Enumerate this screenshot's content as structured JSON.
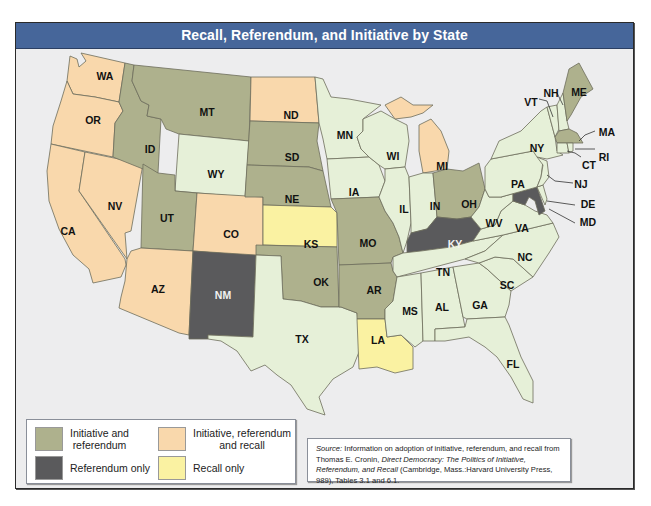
{
  "title": "Recall, Referendum, and Initiative by State",
  "colors": {
    "initiative_referendum": "#aeb18d",
    "initiative_referendum_recall": "#f9d8ac",
    "referendum_only": "#5a5a5c",
    "recall_only": "#faf2a2",
    "none": "#e6f0d8",
    "water": "#ededee",
    "title_bar": "#46669a"
  },
  "legend": {
    "items": [
      {
        "key": "initiative_referendum",
        "label_line1": "Initiative and",
        "label_line2": "referendum"
      },
      {
        "key": "initiative_referendum_recall",
        "label_line1": "Initiative, referendum",
        "label_line2": "and recall"
      },
      {
        "key": "referendum_only",
        "label_line1": "Referendum only",
        "label_line2": ""
      },
      {
        "key": "recall_only",
        "label_line1": "Recall only",
        "label_line2": ""
      }
    ]
  },
  "source": {
    "label": "Source:",
    "text1": " Information on adoption of initiative, referendum, and recall from Thomas E. Cronin, ",
    "italic1": "Direct Democracy: The Politics of Initiative, Referendum, and Recall",
    "text2": " (Cambridge, Mass.:Harvard  University Press, 989), Tables 3.1 and 6.1."
  },
  "states": {
    "WA": "initiative_referendum_recall",
    "OR": "initiative_referendum_recall",
    "CA": "initiative_referendum_recall",
    "NV": "initiative_referendum_recall",
    "AZ": "initiative_referendum_recall",
    "CO": "initiative_referendum_recall",
    "ND": "initiative_referendum_recall",
    "MI": "initiative_referendum_recall",
    "ID": "initiative_referendum",
    "MT": "initiative_referendum",
    "UT": "initiative_referendum",
    "SD": "initiative_referendum",
    "NE": "initiative_referendum",
    "OK": "initiative_referendum",
    "MO": "initiative_referendum",
    "AR": "initiative_referendum",
    "OH": "initiative_referendum",
    "ME": "initiative_referendum",
    "MA": "initiative_referendum",
    "NM": "referendum_only",
    "KY": "referendum_only",
    "MD": "referendum_only",
    "KS": "recall_only",
    "LA": "recall_only",
    "WY": "none",
    "TX": "none",
    "MN": "none",
    "IA": "none",
    "WI": "none",
    "IL": "none",
    "IN": "none",
    "TN": "none",
    "MS": "none",
    "AL": "none",
    "GA": "none",
    "FL": "none",
    "SC": "none",
    "NC": "none",
    "VA": "none",
    "WV": "none",
    "PA": "none",
    "NY": "none",
    "NJ": "none",
    "DE": "none",
    "CT": "none",
    "RI": "none",
    "VT": "none",
    "NH": "none"
  },
  "labels": [
    "WA",
    "OR",
    "CA",
    "NV",
    "ID",
    "MT",
    "WY",
    "UT",
    "AZ",
    "CO",
    "NM",
    "ND",
    "SD",
    "NE",
    "KS",
    "OK",
    "TX",
    "MN",
    "IA",
    "MO",
    "AR",
    "LA",
    "WI",
    "IL",
    "MI",
    "IN",
    "OH",
    "KY",
    "TN",
    "MS",
    "AL",
    "GA",
    "FL",
    "SC",
    "NC",
    "VA",
    "WV",
    "PA",
    "NY",
    "ME",
    "NH",
    "VT",
    "MA",
    "RI",
    "CT",
    "NJ",
    "DE",
    "MD"
  ]
}
